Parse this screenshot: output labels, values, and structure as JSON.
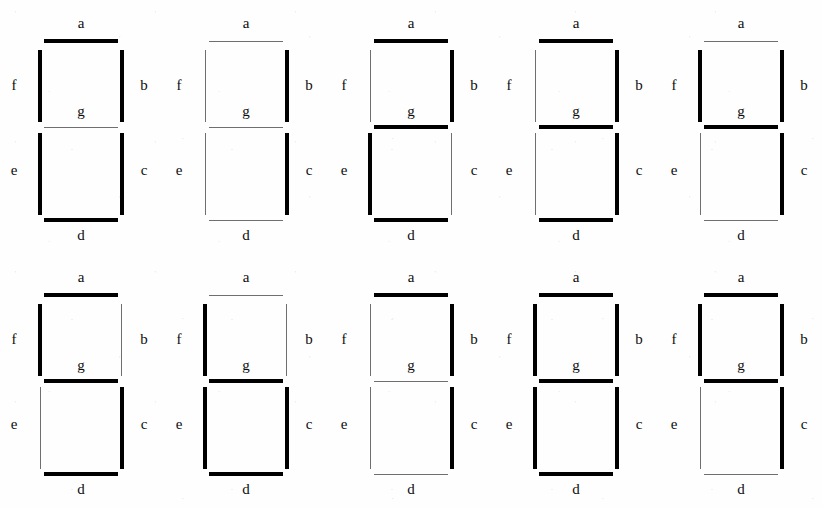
{
  "figure": {
    "type": "seven-segment-display-chart",
    "rows": 2,
    "columns": 5,
    "segment_labels": [
      "a",
      "b",
      "c",
      "d",
      "e",
      "f",
      "g"
    ],
    "label_text": {
      "a": "a",
      "b": "b",
      "c": "c",
      "d": "d",
      "e": "e",
      "f": "f",
      "g": "g"
    },
    "colors": {
      "segment_on": "#000000",
      "segment_off": "#6f6f6f",
      "background": "#ffffff",
      "label": "#0d0d0d"
    }
  },
  "displays": [
    {
      "digit": "0",
      "segments": {
        "a": true,
        "b": true,
        "c": true,
        "d": true,
        "e": true,
        "f": true,
        "g": false
      }
    },
    {
      "digit": "1",
      "segments": {
        "a": false,
        "b": true,
        "c": true,
        "d": false,
        "e": false,
        "f": false,
        "g": false
      }
    },
    {
      "digit": "2",
      "segments": {
        "a": true,
        "b": true,
        "c": false,
        "d": true,
        "e": true,
        "f": false,
        "g": true
      }
    },
    {
      "digit": "3",
      "segments": {
        "a": true,
        "b": true,
        "c": true,
        "d": true,
        "e": false,
        "f": false,
        "g": true
      }
    },
    {
      "digit": "4",
      "segments": {
        "a": false,
        "b": true,
        "c": true,
        "d": false,
        "e": false,
        "f": true,
        "g": true
      }
    },
    {
      "digit": "5",
      "segments": {
        "a": true,
        "b": false,
        "c": true,
        "d": true,
        "e": false,
        "f": true,
        "g": true
      }
    },
    {
      "digit": "6",
      "segments": {
        "a": false,
        "b": false,
        "c": true,
        "d": true,
        "e": true,
        "f": true,
        "g": true
      }
    },
    {
      "digit": "7",
      "segments": {
        "a": true,
        "b": true,
        "c": true,
        "d": false,
        "e": false,
        "f": false,
        "g": false
      }
    },
    {
      "digit": "8",
      "segments": {
        "a": true,
        "b": true,
        "c": true,
        "d": true,
        "e": true,
        "f": true,
        "g": true
      }
    },
    {
      "digit": "9",
      "segments": {
        "a": true,
        "b": true,
        "c": true,
        "d": false,
        "e": false,
        "f": true,
        "g": true
      }
    }
  ]
}
